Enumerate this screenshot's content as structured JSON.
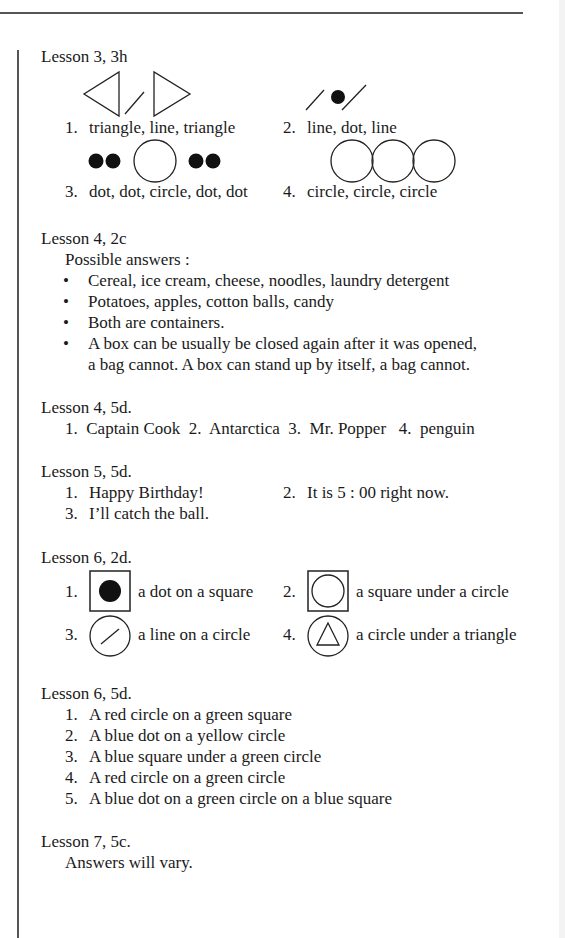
{
  "sections": [
    {
      "heading": "Lesson 3, 3h",
      "items": [
        {
          "num": "1.",
          "text": "triangle, line, triangle"
        },
        {
          "num": "2.",
          "text": "line, dot, line"
        },
        {
          "num": "3.",
          "text": "dot, dot, circle, dot, dot"
        },
        {
          "num": "4.",
          "text": "circle, circle, circle"
        }
      ]
    },
    {
      "heading": "Lesson 4, 2c",
      "intro": "Possible answers :",
      "bullets": [
        "Cereal, ice cream, cheese, noodles, laundry detergent",
        "Potatoes, apples, cotton balls, candy",
        "Both are containers.",
        "A box can be usually be closed again after it was opened,",
        "a bag cannot.  A box can stand up by itself, a bag cannot."
      ],
      "bullet_symbol": "•"
    },
    {
      "heading": "Lesson 4, 5d.",
      "line": "1.  Captain Cook  2.  Antarctica  3.  Mr. Popper   4.  penguin"
    },
    {
      "heading": "Lesson 5, 5d.",
      "items": [
        {
          "num": "1.",
          "text": "Happy Birthday!"
        },
        {
          "num": "2.",
          "text": "It is 5 : 00 right now."
        },
        {
          "num": "3.",
          "text": "I’ll catch the ball."
        }
      ]
    },
    {
      "heading": "Lesson 6, 2d.",
      "items": [
        {
          "num": "1.",
          "text": "a dot on a square"
        },
        {
          "num": "2.",
          "text": "a square under a circle"
        },
        {
          "num": "3.",
          "text": "a line on a circle"
        },
        {
          "num": "4.",
          "text": "a circle under a triangle"
        }
      ]
    },
    {
      "heading": "Lesson 6, 5d.",
      "items": [
        {
          "num": "1.",
          "text": "A red circle on a green square"
        },
        {
          "num": "2.",
          "text": "A blue dot on a yellow circle"
        },
        {
          "num": "3.",
          "text": "A blue square under a green circle"
        },
        {
          "num": "4.",
          "text": "A red circle on a green circle"
        },
        {
          "num": "5.",
          "text": "A blue dot on a green circle on a blue square"
        }
      ]
    },
    {
      "heading": "Lesson 7, 5c.",
      "text": "Answers will vary."
    }
  ]
}
